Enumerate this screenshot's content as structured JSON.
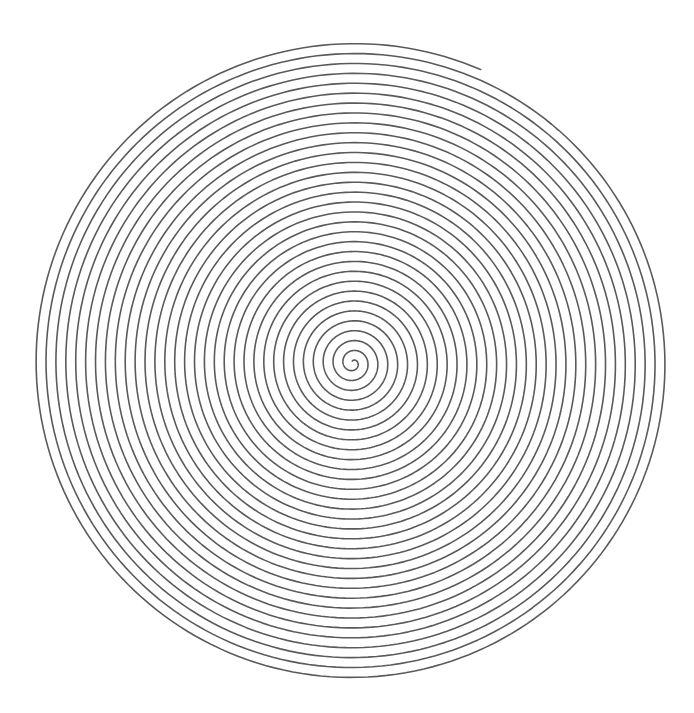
{
  "figure": {
    "background_color": "#ffffff",
    "stroke_color": "#5a5a5a",
    "stroke_width": 1.6
  },
  "spiral": {
    "center_x": 353,
    "center_y": 363,
    "pitch_px": 9.9,
    "start_radius": 2,
    "end_radius": 320,
    "end_angle_deg": -66.5,
    "direction": "clockwise-outward",
    "turns": 32
  }
}
